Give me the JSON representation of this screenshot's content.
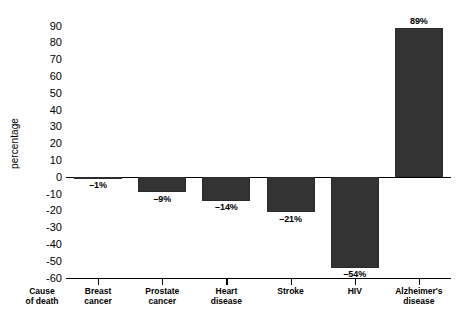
{
  "chart_data": {
    "type": "bar",
    "title": "",
    "subtitle": "",
    "xlabel": "Cause of death",
    "ylabel": "percentage",
    "categories": [
      "Breast cancer",
      "Prostate cancer",
      "Heart disease",
      "Stroke",
      "HIV",
      "Alzheimer's disease"
    ],
    "category_lines": [
      [
        "Breast",
        "cancer"
      ],
      [
        "Prostate",
        "cancer"
      ],
      [
        "Heart",
        "disease"
      ],
      [
        "Stroke",
        ""
      ],
      [
        "HIV",
        ""
      ],
      [
        "Alzheimer's",
        "disease"
      ]
    ],
    "values": [
      -1,
      -9,
      -14,
      -21,
      -54,
      89
    ],
    "data_labels": [
      "–1%",
      "–9%",
      "–14%",
      "–21%",
      "–54%",
      "89%"
    ],
    "ylim": [
      -60,
      90
    ],
    "ytick_labels": [
      "90",
      "80",
      "70",
      "60",
      "50",
      "40",
      "30",
      "20",
      "10",
      "0",
      "-10",
      "-20",
      "-30",
      "-40",
      "-50",
      "-60"
    ],
    "ytick_values": [
      90,
      80,
      70,
      60,
      50,
      40,
      30,
      20,
      10,
      0,
      -10,
      -20,
      -30,
      -40,
      -50,
      -60
    ],
    "grid": false,
    "legend": false,
    "bar_color": "#333333",
    "axis_color": "#000000",
    "background": "#ffffff"
  },
  "axis": {
    "y_title": "percentage",
    "x_title_lines": [
      "Cause",
      "of death"
    ]
  }
}
